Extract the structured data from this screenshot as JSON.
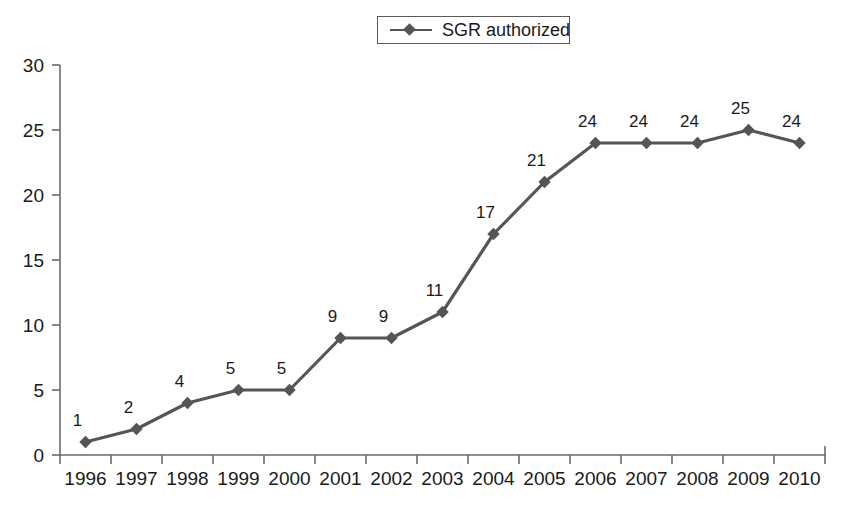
{
  "legend": {
    "entries": [
      {
        "label": "SGR authorized",
        "marker": "line-diamond-marker",
        "color": "#555555"
      }
    ],
    "position": "top-center",
    "bordered": true
  },
  "chart_data": {
    "type": "line",
    "title": "",
    "subtitle": "",
    "xlabel": "",
    "ylabel": "",
    "categories": [
      "1996",
      "1997",
      "1998",
      "1999",
      "2000",
      "2001",
      "2002",
      "2003",
      "2004",
      "2005",
      "2006",
      "2007",
      "2008",
      "2009",
      "2010"
    ],
    "series": [
      {
        "name": "SGR authorized",
        "color": "#555555",
        "marker": "diamond",
        "values": [
          1,
          2,
          4,
          5,
          5,
          9,
          9,
          11,
          17,
          21,
          24,
          24,
          24,
          25,
          24
        ]
      }
    ],
    "data_labels": [
      "1",
      "2",
      "4",
      "5",
      "5",
      "9",
      "9",
      "11",
      "17",
      "21",
      "24",
      "24",
      "24",
      "25",
      "24"
    ],
    "ylim": [
      0,
      30
    ],
    "ytick_values": [
      0,
      5,
      10,
      15,
      20,
      25,
      30
    ],
    "ytick_labels": [
      "0",
      "5",
      "10",
      "15",
      "20",
      "25",
      "30"
    ],
    "xtick_labels": [
      "1996",
      "1997",
      "1998",
      "1999",
      "2000",
      "2001",
      "2002",
      "2003",
      "2004",
      "2005",
      "2006",
      "2007",
      "2008",
      "2009",
      "2010"
    ],
    "grid": false,
    "legend_position": "top-center",
    "background_color": "#ffffff",
    "axis_color": "#6b6b6b"
  }
}
